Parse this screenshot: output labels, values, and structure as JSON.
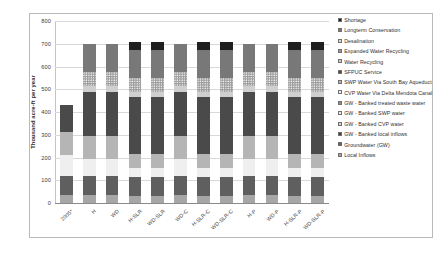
{
  "chart_data": {
    "type": "bar",
    "stacked": true,
    "title": "",
    "xlabel": "",
    "ylabel": "Thousand acre-ft per year",
    "ylim": [
      0,
      800
    ],
    "yticks": [
      0,
      100,
      200,
      300,
      400,
      500,
      600,
      700,
      800
    ],
    "grid": true,
    "legend_position": "right",
    "categories": [
      "2005*",
      "H",
      "WD",
      "H-SLR",
      "WD-SLR",
      "WD-C",
      "H-SLR-C",
      "WD-SLR-C",
      "H-P",
      "WD-P",
      "H-SLR-P",
      "WD-SLR-P"
    ],
    "series": [
      {
        "name": "Local Inflows",
        "color": "#a6a6a6",
        "pattern": "solid",
        "values": [
          36,
          36,
          36,
          30,
          30,
          36,
          30,
          30,
          36,
          36,
          30,
          30
        ]
      },
      {
        "name": "Groundwater (GW)",
        "color": "#5f5f5f",
        "pattern": "solid",
        "values": [
          84,
          84,
          84,
          84,
          84,
          84,
          84,
          84,
          84,
          84,
          84,
          84
        ]
      },
      {
        "name": "GW - Banked local inflows",
        "color": "#3f3f3f",
        "pattern": "solid",
        "values": [
          0,
          0,
          0,
          0,
          0,
          0,
          0,
          0,
          0,
          0,
          0,
          0
        ]
      },
      {
        "name": "GW - Banked CVP water",
        "color": "#d6d6d6",
        "pattern": "dots",
        "values": [
          0,
          0,
          0,
          0,
          0,
          0,
          0,
          0,
          0,
          0,
          0,
          0
        ]
      },
      {
        "name": "GW - Banked SWP water",
        "color": "#ededed",
        "pattern": "dots",
        "values": [
          0,
          0,
          0,
          0,
          0,
          0,
          0,
          0,
          0,
          0,
          0,
          0
        ]
      },
      {
        "name": "GW - Banked treated waste water",
        "color": "#8f8f8f",
        "pattern": "dots-dark",
        "values": [
          0,
          0,
          0,
          0,
          0,
          0,
          0,
          0,
          0,
          0,
          0,
          0
        ]
      },
      {
        "name": "CVP Water Via Delta Mendota Canal",
        "color": "#efefef",
        "pattern": "solid",
        "values": [
          92,
          75,
          75,
          40,
          40,
          75,
          40,
          40,
          75,
          75,
          40,
          40
        ]
      },
      {
        "name": "SWP Water Via South Bay Aqueduct",
        "color": "#b5b5b5",
        "pattern": "solid",
        "values": [
          100,
          100,
          100,
          60,
          60,
          100,
          60,
          60,
          100,
          100,
          60,
          60
        ]
      },
      {
        "name": "SFPUC Service",
        "color": "#4a4a4a",
        "pattern": "solid",
        "values": [
          118,
          195,
          195,
          250,
          250,
          195,
          250,
          250,
          195,
          195,
          250,
          250
        ]
      },
      {
        "name": "Water Recycling",
        "color": "#cfcfcf",
        "pattern": "solid",
        "values": [
          0,
          25,
          25,
          25,
          25,
          25,
          25,
          25,
          25,
          25,
          25,
          25
        ]
      },
      {
        "name": "Expanded Water Recycling",
        "color": "#9c9c9c",
        "pattern": "dots",
        "values": [
          0,
          60,
          60,
          60,
          60,
          60,
          60,
          60,
          60,
          60,
          60,
          60
        ]
      },
      {
        "name": "Desalination",
        "color": "#dedede",
        "pattern": "solid",
        "values": [
          0,
          0,
          0,
          0,
          0,
          0,
          0,
          0,
          0,
          0,
          0,
          0
        ]
      },
      {
        "name": "Longterm Conservation",
        "color": "#787878",
        "pattern": "solid",
        "values": [
          0,
          125,
          125,
          125,
          125,
          125,
          125,
          125,
          125,
          125,
          125,
          125
        ]
      },
      {
        "name": "Shortage",
        "color": "#1f1f1f",
        "pattern": "solid",
        "values": [
          0,
          0,
          0,
          36,
          36,
          0,
          36,
          36,
          0,
          0,
          36,
          36
        ]
      }
    ],
    "legend_order": [
      "Shortage",
      "Longterm Conservation",
      "Desalination",
      "Expanded Water Recycling",
      "Water Recycling",
      "SFPUC Service",
      "SWP Water Via South Bay Aqueduct",
      "CVP Water Via Delta Mendota Canal",
      "GW - Banked treated waste water",
      "GW - Banked SWP water",
      "GW - Banked CVP water",
      "GW - Banked local inflows",
      "Groundwater (GW)",
      "Local Inflows"
    ]
  }
}
